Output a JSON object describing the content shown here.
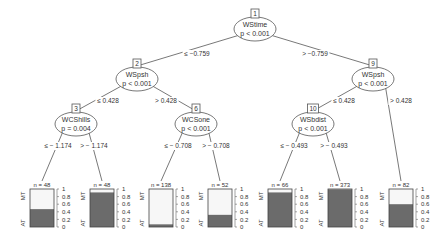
{
  "tree": {
    "inner_nodes": [
      {
        "id": "1",
        "variable": "WStime",
        "pvalue": "p < 0.001"
      },
      {
        "id": "2",
        "variable": "WSpsh",
        "pvalue": "p < 0.001"
      },
      {
        "id": "3",
        "variable": "WCShills",
        "pvalue": "p = 0.004"
      },
      {
        "id": "6",
        "variable": "WCSone",
        "pvalue": "p < 0.001"
      },
      {
        "id": "9",
        "variable": "WSpsh",
        "pvalue": "p < 0.001"
      },
      {
        "id": "10",
        "variable": "WSbdist",
        "pvalue": "p < 0.001"
      }
    ],
    "edges": [
      {
        "from": "1",
        "to": "2",
        "label": "≤ −0.759"
      },
      {
        "from": "1",
        "to": "9",
        "label": "> −0.759"
      },
      {
        "from": "2",
        "to": "3",
        "label": "≤ 0.428"
      },
      {
        "from": "2",
        "to": "6",
        "label": "> 0.428"
      },
      {
        "from": "3",
        "to": "4",
        "label": "≤ − 1.174"
      },
      {
        "from": "3",
        "to": "5",
        "label": "> − 1.174"
      },
      {
        "from": "6",
        "to": "7",
        "label": "≤ − 0.708"
      },
      {
        "from": "6",
        "to": "8",
        "label": "> − 0.708"
      },
      {
        "from": "9",
        "to": "10",
        "label": "≤ 0.428"
      },
      {
        "from": "9",
        "to": "13",
        "label": "> 0.428"
      },
      {
        "from": "10",
        "to": "11",
        "label": "≤ − 0.493"
      },
      {
        "from": "10",
        "to": "12",
        "label": "> − 0.493"
      }
    ],
    "terminal_nodes": [
      {
        "id": "4",
        "n_label": "n = 48",
        "at_fraction": 0.47
      },
      {
        "id": "5",
        "n_label": "n = 48",
        "at_fraction": 0.91
      },
      {
        "id": "7",
        "n_label": "n = 138",
        "at_fraction": 0.07
      },
      {
        "id": "8",
        "n_label": "n = 52",
        "at_fraction": 0.32
      },
      {
        "id": "11",
        "n_label": "n = 66",
        "at_fraction": 0.91
      },
      {
        "id": "12",
        "n_label": "n = 373",
        "at_fraction": 0.99
      },
      {
        "id": "13",
        "n_label": "n = 82",
        "at_fraction": 0.6
      }
    ],
    "bar_labels": {
      "top": "MT",
      "bottom": "AT"
    },
    "axis_ticks": [
      "0",
      "0.2",
      "0.4",
      "0.6",
      "0.8",
      "1"
    ],
    "colors": {
      "at_fill": "#6b6b6b",
      "mt_fill": "#f7f7f7",
      "line": "#555555",
      "text": "#333333"
    }
  }
}
